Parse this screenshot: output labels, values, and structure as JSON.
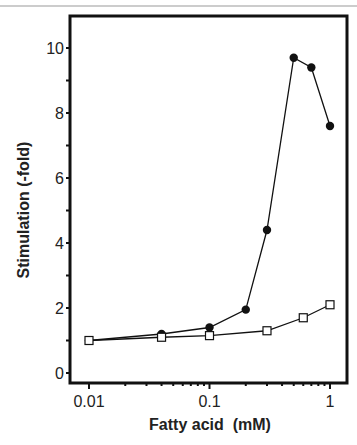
{
  "chart_data": {
    "type": "line",
    "title": "",
    "xlabel": "Fatty acid  (mM)",
    "ylabel": "Stimulation  (-fold)",
    "xscale": "log",
    "xlim": [
      0.01,
      1
    ],
    "ylim": [
      0,
      11
    ],
    "xticks": [
      "0.01",
      "0.1",
      "1"
    ],
    "yticks": [
      "0",
      "2",
      "4",
      "6",
      "8",
      "10"
    ],
    "grid": false,
    "legend": null,
    "series": [
      {
        "name": "filled circles",
        "marker": "filled-circle",
        "x": [
          0.01,
          0.04,
          0.1,
          0.2,
          0.3,
          0.5,
          0.7,
          1.0
        ],
        "values": [
          1.0,
          1.2,
          1.4,
          1.95,
          4.4,
          9.7,
          9.4,
          7.6
        ]
      },
      {
        "name": "open squares",
        "marker": "open-square",
        "x": [
          0.01,
          0.04,
          0.1,
          0.3,
          0.6,
          1.0
        ],
        "values": [
          1.0,
          1.1,
          1.15,
          1.3,
          1.7,
          2.1
        ]
      }
    ]
  }
}
